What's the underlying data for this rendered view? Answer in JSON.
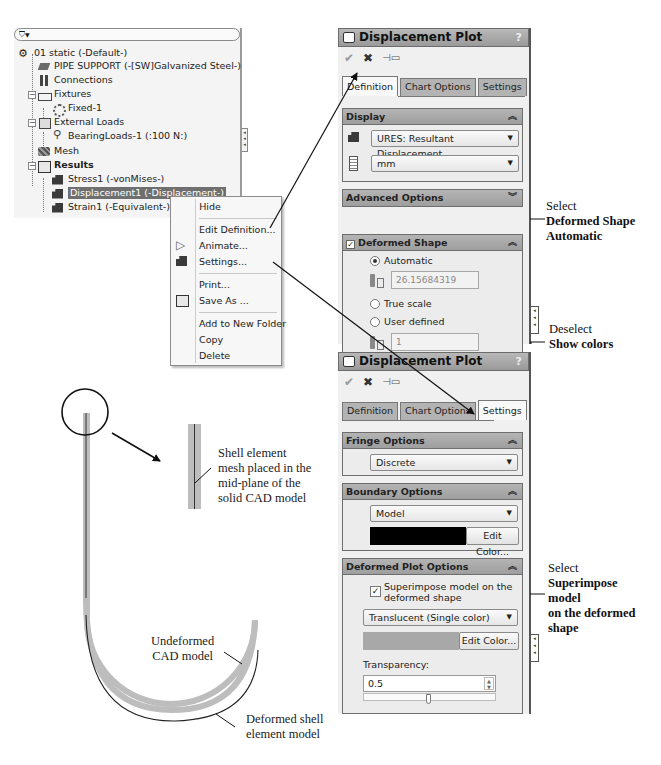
{
  "feature_tree": {
    "filter_label": "▼",
    "study": "01 static (-Default-)",
    "part": "PIPE SUPPORT (-[SW]Galvanized Steel-)",
    "connections": "Connections",
    "fixtures": "Fixtures",
    "fixture_item": "Fixed-1",
    "external_loads": "External Loads",
    "load_item": "BearingLoads-1 (:100 N:)",
    "mesh": "Mesh",
    "results": "Results",
    "result_items": [
      "Stress1 (-vonMises-)",
      "Displacement1 (-Displacement-)",
      "Strain1 (-Equivalent-)"
    ],
    "selected_index": 1
  },
  "context_menu": {
    "items": [
      {
        "label": "Hide",
        "mnemonic": "H"
      },
      {
        "label": "Edit Definition...",
        "mnemonic": "E"
      },
      {
        "label": "Animate...",
        "mnemonic": "A"
      },
      {
        "label": "Settings...",
        "mnemonic": "t"
      },
      {
        "label": "Print...",
        "mnemonic": "P"
      },
      {
        "label": "Save As ...",
        "mnemonic": "v"
      },
      {
        "label": "Add to New Folder",
        "mnemonic": "F"
      },
      {
        "label": "Copy",
        "mnemonic": "C"
      },
      {
        "label": "Delete",
        "mnemonic": "D"
      }
    ]
  },
  "panel_definition": {
    "title": "Displacement Plot",
    "help": "?",
    "tabs": [
      "Definition",
      "Chart Options",
      "Settings"
    ],
    "active_tab": "Definition",
    "display": {
      "header": "Display",
      "component": "URES: Resultant Displacement",
      "units": "mm"
    },
    "advanced": {
      "header": "Advanced Options"
    },
    "deformed_shape": {
      "header": "Deformed Shape",
      "checked": true,
      "automatic_label": "Automatic",
      "automatic_value": "26.15684319",
      "true_scale_label": "True scale",
      "user_defined_label": "User defined",
      "user_defined_value": "1",
      "selected": "Automatic",
      "show_colors_label": "Show colors",
      "show_colors_checked": false
    }
  },
  "panel_settings": {
    "title": "Displacement Plot",
    "help": "?",
    "tabs": [
      "Definition",
      "Chart Options",
      "Settings"
    ],
    "active_tab": "Settings",
    "fringe": {
      "header": "Fringe Options",
      "value": "Discrete"
    },
    "boundary": {
      "header": "Boundary Options",
      "value": "Model",
      "color": "#000000",
      "edit_color_label": "Edit Color..."
    },
    "deformed_plot": {
      "header": "Deformed Plot Options",
      "superimpose_label": "Superimpose model on the deformed shape",
      "superimpose_line1": "Superimpose model on the",
      "superimpose_line2": "deformed shape",
      "superimpose_checked": true,
      "mode": "Translucent (Single color)",
      "color": "#a8a8a8",
      "edit_color_label": "Edit Color...",
      "transparency_label": "Transparency:",
      "transparency_value": "0.5"
    }
  },
  "annotations": {
    "deformed_shape": {
      "line1": "Select",
      "line2": "Deformed Shape",
      "line3": "Automatic"
    },
    "show_colors": {
      "line1": "Deselect",
      "line2": "Show colors"
    },
    "superimpose": {
      "line1": "Select",
      "line2": "Superimpose",
      "line3": "model",
      "line4": "on the deformed",
      "line5": "shape"
    },
    "shell_mesh": {
      "line1": "Shell element",
      "line2": "mesh placed in the",
      "line3": "mid-plane of the",
      "line4": "solid CAD model"
    },
    "undeformed": {
      "line1": "Undeformed",
      "line2": "CAD model"
    },
    "deformed": {
      "line1": "Deformed shell",
      "line2": "element model"
    }
  }
}
